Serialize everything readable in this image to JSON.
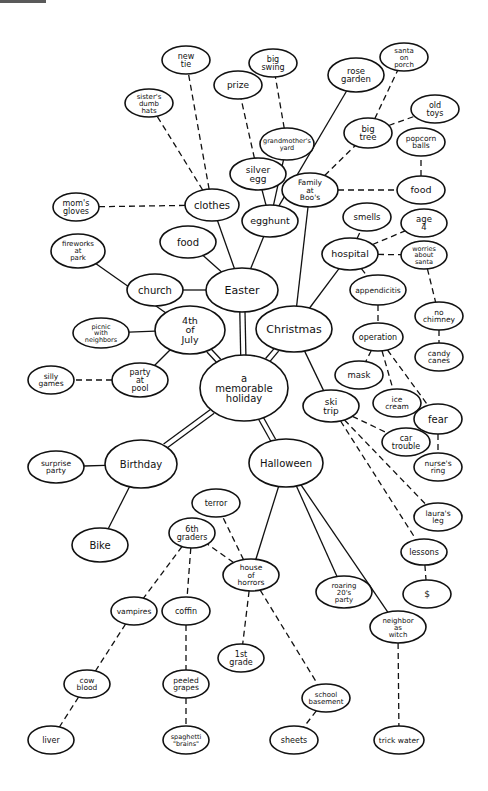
{
  "diagram": {
    "type": "concept-map",
    "colors": {
      "ink": "#111111",
      "background": "#ffffff"
    },
    "nodes": [
      {
        "id": "root",
        "lines": [
          "a",
          "memorable",
          "holiday"
        ],
        "x": 244,
        "y": 388,
        "rx": 44,
        "ry": 33,
        "fs": 10
      },
      {
        "id": "easter",
        "lines": [
          "Easter"
        ],
        "x": 242,
        "y": 290,
        "rx": 36,
        "ry": 22,
        "fs": 11
      },
      {
        "id": "christmas",
        "lines": [
          "Christmas"
        ],
        "x": 294,
        "y": 329,
        "rx": 38,
        "ry": 23,
        "fs": 11
      },
      {
        "id": "july4",
        "lines": [
          "4th",
          "of",
          "July"
        ],
        "x": 190,
        "y": 330,
        "rx": 35,
        "ry": 24,
        "fs": 9.5
      },
      {
        "id": "birthday",
        "lines": [
          "Birthday"
        ],
        "x": 141,
        "y": 464,
        "rx": 36,
        "ry": 24,
        "fs": 10
      },
      {
        "id": "halloween",
        "lines": [
          "Halloween"
        ],
        "x": 286,
        "y": 463,
        "rx": 37,
        "ry": 24,
        "fs": 10
      },
      {
        "id": "clothes",
        "lines": [
          "clothes"
        ],
        "x": 212,
        "y": 205,
        "rx": 27,
        "ry": 16,
        "fs": 10
      },
      {
        "id": "moms-gloves",
        "lines": [
          "mom's",
          "gloves"
        ],
        "x": 76,
        "y": 207,
        "rx": 23,
        "ry": 14,
        "fs": 8
      },
      {
        "id": "sisters-hats",
        "lines": [
          "sister's",
          "dumb",
          "hats"
        ],
        "x": 149,
        "y": 103,
        "rx": 24,
        "ry": 14,
        "fs": 7
      },
      {
        "id": "new-tie",
        "lines": [
          "new",
          "tie"
        ],
        "x": 186,
        "y": 60,
        "rx": 24,
        "ry": 14,
        "fs": 8
      },
      {
        "id": "prize",
        "lines": [
          "prize"
        ],
        "x": 238,
        "y": 85,
        "rx": 24,
        "ry": 14,
        "fs": 9
      },
      {
        "id": "big-swing",
        "lines": [
          "big",
          "swing"
        ],
        "x": 273,
        "y": 63,
        "rx": 24,
        "ry": 14,
        "fs": 8
      },
      {
        "id": "grandmothers-yard",
        "lines": [
          "grandmother's",
          "yard"
        ],
        "x": 287,
        "y": 144,
        "rx": 27,
        "ry": 16,
        "fs": 6.5
      },
      {
        "id": "silver-egg",
        "lines": [
          "silver",
          "egg"
        ],
        "x": 258,
        "y": 174,
        "rx": 28,
        "ry": 16,
        "fs": 9
      },
      {
        "id": "egghunt",
        "lines": [
          "egghunt"
        ],
        "x": 270,
        "y": 221,
        "rx": 28,
        "ry": 16,
        "fs": 9.5
      },
      {
        "id": "food-easter",
        "lines": [
          "food"
        ],
        "x": 188,
        "y": 242,
        "rx": 28,
        "ry": 16,
        "fs": 10
      },
      {
        "id": "church",
        "lines": [
          "church"
        ],
        "x": 155,
        "y": 290,
        "rx": 28,
        "ry": 16,
        "fs": 10
      },
      {
        "id": "rose-garden",
        "lines": [
          "rose",
          "garden"
        ],
        "x": 356,
        "y": 75,
        "rx": 28,
        "ry": 17,
        "fs": 8.5
      },
      {
        "id": "santa-porch",
        "lines": [
          "santa",
          "on",
          "porch"
        ],
        "x": 404,
        "y": 57,
        "rx": 24,
        "ry": 14,
        "fs": 7
      },
      {
        "id": "big-tree",
        "lines": [
          "big",
          "tree"
        ],
        "x": 368,
        "y": 133,
        "rx": 24,
        "ry": 15,
        "fs": 8.5
      },
      {
        "id": "old-toys",
        "lines": [
          "old",
          "toys"
        ],
        "x": 435,
        "y": 109,
        "rx": 24,
        "ry": 14,
        "fs": 8
      },
      {
        "id": "popcorn-balls",
        "lines": [
          "popcorn",
          "balls"
        ],
        "x": 421,
        "y": 142,
        "rx": 24,
        "ry": 14,
        "fs": 7.5
      },
      {
        "id": "family-boos",
        "lines": [
          "Family",
          "at",
          "Boo's"
        ],
        "x": 310,
        "y": 190,
        "rx": 28,
        "ry": 17,
        "fs": 7.5
      },
      {
        "id": "food-christmas",
        "lines": [
          "food"
        ],
        "x": 421,
        "y": 190,
        "rx": 24,
        "ry": 14,
        "fs": 9.5
      },
      {
        "id": "smells",
        "lines": [
          "smells"
        ],
        "x": 367,
        "y": 217,
        "rx": 24,
        "ry": 14,
        "fs": 8.5
      },
      {
        "id": "age-4",
        "lines": [
          "age",
          "4"
        ],
        "x": 424,
        "y": 223,
        "rx": 23,
        "ry": 14,
        "fs": 8.5
      },
      {
        "id": "hospital",
        "lines": [
          "hospital"
        ],
        "x": 350,
        "y": 254,
        "rx": 28,
        "ry": 16,
        "fs": 9.5
      },
      {
        "id": "worries-santa",
        "lines": [
          "worries",
          "about",
          "santa"
        ],
        "x": 424,
        "y": 255,
        "rx": 23,
        "ry": 14,
        "fs": 6.5
      },
      {
        "id": "appendicitis",
        "lines": [
          "appendicitis"
        ],
        "x": 378,
        "y": 290,
        "rx": 28,
        "ry": 15,
        "fs": 7.5
      },
      {
        "id": "no-chimney",
        "lines": [
          "no",
          "chimney"
        ],
        "x": 439,
        "y": 316,
        "rx": 24,
        "ry": 14,
        "fs": 7.5
      },
      {
        "id": "operation",
        "lines": [
          "operation"
        ],
        "x": 378,
        "y": 337,
        "rx": 25,
        "ry": 14,
        "fs": 8
      },
      {
        "id": "candy-canes",
        "lines": [
          "candy",
          "canes"
        ],
        "x": 439,
        "y": 357,
        "rx": 24,
        "ry": 14,
        "fs": 7.5
      },
      {
        "id": "mask",
        "lines": [
          "mask"
        ],
        "x": 359,
        "y": 375,
        "rx": 24,
        "ry": 14,
        "fs": 8.5
      },
      {
        "id": "ice-cream",
        "lines": [
          "ice",
          "cream"
        ],
        "x": 397,
        "y": 403,
        "rx": 24,
        "ry": 14,
        "fs": 7.5
      },
      {
        "id": "ski-trip",
        "lines": [
          "ski",
          "trip"
        ],
        "x": 331,
        "y": 406,
        "rx": 28,
        "ry": 16,
        "fs": 9
      },
      {
        "id": "fear",
        "lines": [
          "fear"
        ],
        "x": 438,
        "y": 419,
        "rx": 24,
        "ry": 15,
        "fs": 10
      },
      {
        "id": "car-trouble",
        "lines": [
          "car",
          "trouble"
        ],
        "x": 406,
        "y": 442,
        "rx": 24,
        "ry": 14,
        "fs": 8
      },
      {
        "id": "nurses-ring",
        "lines": [
          "nurse's",
          "ring"
        ],
        "x": 438,
        "y": 467,
        "rx": 24,
        "ry": 14,
        "fs": 7.5
      },
      {
        "id": "lauras-leg",
        "lines": [
          "laura's",
          "leg"
        ],
        "x": 438,
        "y": 517,
        "rx": 24,
        "ry": 14,
        "fs": 7.5
      },
      {
        "id": "lessons",
        "lines": [
          "lessons"
        ],
        "x": 424,
        "y": 552,
        "rx": 23,
        "ry": 13,
        "fs": 8
      },
      {
        "id": "money",
        "lines": [
          "$"
        ],
        "x": 427,
        "y": 594,
        "rx": 24,
        "ry": 14,
        "fs": 9
      },
      {
        "id": "fireworks-park",
        "lines": [
          "fireworks",
          "at",
          "park"
        ],
        "x": 78,
        "y": 251,
        "rx": 27,
        "ry": 17,
        "fs": 7
      },
      {
        "id": "picnic-neighbors",
        "lines": [
          "picnic",
          "with",
          "neighbors"
        ],
        "x": 101,
        "y": 333,
        "rx": 28,
        "ry": 15,
        "fs": 6.5
      },
      {
        "id": "party-pool",
        "lines": [
          "party",
          "at",
          "pool"
        ],
        "x": 140,
        "y": 380,
        "rx": 28,
        "ry": 17,
        "fs": 8
      },
      {
        "id": "silly-games",
        "lines": [
          "silly",
          "games"
        ],
        "x": 51,
        "y": 380,
        "rx": 23,
        "ry": 14,
        "fs": 7.5
      },
      {
        "id": "surprise-party",
        "lines": [
          "surprise",
          "party"
        ],
        "x": 56,
        "y": 467,
        "rx": 28,
        "ry": 16,
        "fs": 7.5
      },
      {
        "id": "bike",
        "lines": [
          "Bike"
        ],
        "x": 100,
        "y": 545,
        "rx": 28,
        "ry": 17,
        "fs": 10
      },
      {
        "id": "terror",
        "lines": [
          "terror"
        ],
        "x": 216,
        "y": 503,
        "rx": 24,
        "ry": 14,
        "fs": 8
      },
      {
        "id": "6th-graders",
        "lines": [
          "6th",
          "graders"
        ],
        "x": 192,
        "y": 533,
        "rx": 23,
        "ry": 15,
        "fs": 8
      },
      {
        "id": "house-horrors",
        "lines": [
          "house",
          "of",
          "horrors"
        ],
        "x": 251,
        "y": 575,
        "rx": 28,
        "ry": 16,
        "fs": 7.5
      },
      {
        "id": "roaring-20s",
        "lines": [
          "roaring",
          "20's",
          "party"
        ],
        "x": 344,
        "y": 592,
        "rx": 28,
        "ry": 16,
        "fs": 7
      },
      {
        "id": "vampires",
        "lines": [
          "vampires"
        ],
        "x": 134,
        "y": 611,
        "rx": 23,
        "ry": 14,
        "fs": 7.5
      },
      {
        "id": "coffin",
        "lines": [
          "coffin"
        ],
        "x": 186,
        "y": 611,
        "rx": 24,
        "ry": 14,
        "fs": 8
      },
      {
        "id": "neighbor-witch",
        "lines": [
          "neighbor",
          "as",
          "witch"
        ],
        "x": 398,
        "y": 627,
        "rx": 28,
        "ry": 16,
        "fs": 7
      },
      {
        "id": "1st-grade",
        "lines": [
          "1st",
          "grade"
        ],
        "x": 241,
        "y": 658,
        "rx": 23,
        "ry": 14,
        "fs": 8
      },
      {
        "id": "cow-blood",
        "lines": [
          "cow",
          "blood"
        ],
        "x": 87,
        "y": 684,
        "rx": 23,
        "ry": 14,
        "fs": 7.5
      },
      {
        "id": "peeled-grapes",
        "lines": [
          "peeled",
          "grapes"
        ],
        "x": 186,
        "y": 684,
        "rx": 23,
        "ry": 14,
        "fs": 7.5
      },
      {
        "id": "school-basement",
        "lines": [
          "school",
          "basement"
        ],
        "x": 326,
        "y": 698,
        "rx": 24,
        "ry": 14,
        "fs": 7
      },
      {
        "id": "liver",
        "lines": [
          "liver"
        ],
        "x": 51,
        "y": 740,
        "rx": 23,
        "ry": 14,
        "fs": 8
      },
      {
        "id": "spaghetti-brains",
        "lines": [
          "spaghetti",
          "\"brains\""
        ],
        "x": 186,
        "y": 740,
        "rx": 23,
        "ry": 14,
        "fs": 6.5
      },
      {
        "id": "sheets",
        "lines": [
          "sheets"
        ],
        "x": 294,
        "y": 740,
        "rx": 24,
        "ry": 14,
        "fs": 8
      },
      {
        "id": "trick-water",
        "lines": [
          "trick water"
        ],
        "x": 399,
        "y": 740,
        "rx": 25,
        "ry": 14,
        "fs": 7.5
      }
    ],
    "edges": [
      {
        "from": "root",
        "to": "easter",
        "style": "double"
      },
      {
        "from": "root",
        "to": "christmas",
        "style": "double"
      },
      {
        "from": "root",
        "to": "july4",
        "style": "double"
      },
      {
        "from": "root",
        "to": "birthday",
        "style": "double"
      },
      {
        "from": "root",
        "to": "halloween",
        "style": "double"
      },
      {
        "from": "easter",
        "to": "clothes",
        "style": "solid"
      },
      {
        "from": "easter",
        "to": "egghunt",
        "style": "solid"
      },
      {
        "from": "easter",
        "to": "food-easter",
        "style": "solid"
      },
      {
        "from": "easter",
        "to": "church",
        "style": "solid"
      },
      {
        "from": "clothes",
        "to": "moms-gloves",
        "style": "dashed"
      },
      {
        "from": "clothes",
        "to": "sisters-hats",
        "style": "dashed"
      },
      {
        "from": "clothes",
        "to": "new-tie",
        "style": "dashed"
      },
      {
        "from": "egghunt",
        "to": "silver-egg",
        "style": "solid"
      },
      {
        "from": "egghunt",
        "to": "grandmothers-yard",
        "style": "solid"
      },
      {
        "from": "egghunt",
        "to": "rose-garden",
        "style": "solid"
      },
      {
        "from": "silver-egg",
        "to": "prize",
        "style": "dashed"
      },
      {
        "from": "grandmothers-yard",
        "to": "big-swing",
        "style": "dashed"
      },
      {
        "from": "christmas",
        "to": "family-boos",
        "style": "solid"
      },
      {
        "from": "christmas",
        "to": "hospital",
        "style": "solid"
      },
      {
        "from": "christmas",
        "to": "ski-trip",
        "style": "solid"
      },
      {
        "from": "family-boos",
        "to": "big-tree",
        "style": "dashed"
      },
      {
        "from": "family-boos",
        "to": "food-christmas",
        "style": "dashed"
      },
      {
        "from": "big-tree",
        "to": "santa-porch",
        "style": "dashed"
      },
      {
        "from": "big-tree",
        "to": "old-toys",
        "style": "dashed"
      },
      {
        "from": "food-christmas",
        "to": "popcorn-balls",
        "style": "dashed"
      },
      {
        "from": "hospital",
        "to": "smells",
        "style": "dashed"
      },
      {
        "from": "hospital",
        "to": "age-4",
        "style": "dashed"
      },
      {
        "from": "hospital",
        "to": "worries-santa",
        "style": "dashed"
      },
      {
        "from": "hospital",
        "to": "appendicitis",
        "style": "dashed"
      },
      {
        "from": "worries-santa",
        "to": "no-chimney",
        "style": "dashed"
      },
      {
        "from": "no-chimney",
        "to": "candy-canes",
        "style": "dashed"
      },
      {
        "from": "appendicitis",
        "to": "operation",
        "style": "dashed"
      },
      {
        "from": "operation",
        "to": "mask",
        "style": "dashed"
      },
      {
        "from": "operation",
        "to": "ice-cream",
        "style": "dashed"
      },
      {
        "from": "operation",
        "to": "fear",
        "style": "dashed"
      },
      {
        "from": "fear",
        "to": "nurses-ring",
        "style": "dashed"
      },
      {
        "from": "ski-trip",
        "to": "car-trouble",
        "style": "dashed"
      },
      {
        "from": "ski-trip",
        "to": "lauras-leg",
        "style": "dashed"
      },
      {
        "from": "ski-trip",
        "to": "lessons",
        "style": "dashed"
      },
      {
        "from": "lessons",
        "to": "money",
        "style": "dashed"
      },
      {
        "from": "july4",
        "to": "fireworks-park",
        "style": "solid"
      },
      {
        "from": "july4",
        "to": "picnic-neighbors",
        "style": "solid"
      },
      {
        "from": "july4",
        "to": "party-pool",
        "style": "solid"
      },
      {
        "from": "party-pool",
        "to": "silly-games",
        "style": "dashed"
      },
      {
        "from": "birthday",
        "to": "surprise-party",
        "style": "solid"
      },
      {
        "from": "birthday",
        "to": "bike",
        "style": "solid"
      },
      {
        "from": "halloween",
        "to": "house-horrors",
        "style": "solid"
      },
      {
        "from": "halloween",
        "to": "roaring-20s",
        "style": "solid"
      },
      {
        "from": "halloween",
        "to": "neighbor-witch",
        "style": "solid"
      },
      {
        "from": "house-horrors",
        "to": "terror",
        "style": "dashed"
      },
      {
        "from": "house-horrors",
        "to": "6th-graders",
        "style": "dashed"
      },
      {
        "from": "house-horrors",
        "to": "1st-grade",
        "style": "dashed"
      },
      {
        "from": "house-horrors",
        "to": "school-basement",
        "style": "dashed"
      },
      {
        "from": "6th-graders",
        "to": "vampires",
        "style": "dashed"
      },
      {
        "from": "6th-graders",
        "to": "coffin",
        "style": "dashed"
      },
      {
        "from": "vampires",
        "to": "cow-blood",
        "style": "dashed"
      },
      {
        "from": "cow-blood",
        "to": "liver",
        "style": "dashed"
      },
      {
        "from": "coffin",
        "to": "peeled-grapes",
        "style": "dashed"
      },
      {
        "from": "peeled-grapes",
        "to": "spaghetti-brains",
        "style": "dashed"
      },
      {
        "from": "school-basement",
        "to": "sheets",
        "style": "dashed"
      },
      {
        "from": "neighbor-witch",
        "to": "trick-water",
        "style": "dashed"
      }
    ]
  }
}
